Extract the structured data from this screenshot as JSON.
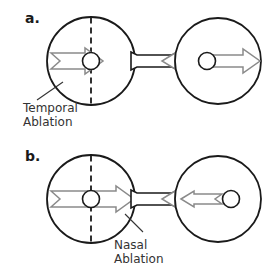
{
  "figure": {
    "background_color": "#ffffff",
    "line_color": "#1a1a1a",
    "arrow_stroke_color": "#8a8a8a",
    "arrow_fill_color": "#ffffff",
    "text_color": "#333333",
    "hatch_color": "#1a1a1a"
  },
  "panels": [
    {
      "id": "panel-a",
      "label": "a.",
      "annotation": {
        "line1": "Temporal",
        "line2": "Ablation",
        "full": "Temporal Ablation",
        "points_to": "left-eye-hatched-region"
      },
      "left_eye": {
        "name": "left-eye",
        "hatched_side": "left",
        "midline": "dashed-vertical",
        "arrow_direction": "right",
        "arrow_style": "notched-tail"
      },
      "right_eye": {
        "name": "right-eye",
        "hatched_side": "none",
        "midline": "none",
        "arrow_direction": "right",
        "arrow_style": "plain-shaft"
      },
      "nerve": {
        "name": "optic-nerve",
        "arrowhead_direction": "left"
      }
    },
    {
      "id": "panel-b",
      "label": "b.",
      "annotation": {
        "line1": "Nasal",
        "line2": "Ablation",
        "full": "Nasal Ablation",
        "points_to": "left-eye-hatched-region"
      },
      "left_eye": {
        "name": "left-eye",
        "hatched_side": "right",
        "midline": "dashed-vertical",
        "arrow_direction": "right",
        "arrow_style": "notched-tail"
      },
      "right_eye": {
        "name": "right-eye",
        "hatched_side": "none",
        "midline": "none",
        "arrow_direction": "left",
        "arrow_style": "notched-tail"
      },
      "nerve": {
        "name": "optic-nerve",
        "arrowhead_direction": "left"
      }
    }
  ]
}
